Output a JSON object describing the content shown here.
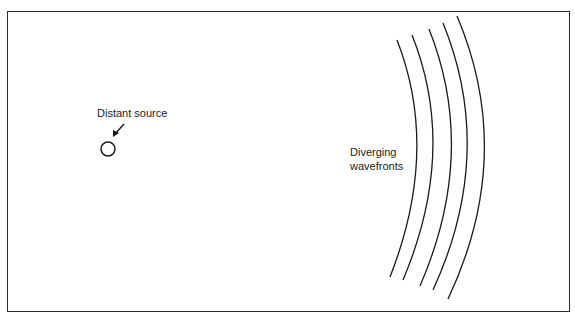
{
  "diagram": {
    "source_label": "Distant source",
    "wavefront_label_line1": "Diverging",
    "wavefront_label_line2": "wavefronts",
    "wavefront_count": 5,
    "line_color": "#1a1a1a",
    "background": "#ffffff"
  }
}
